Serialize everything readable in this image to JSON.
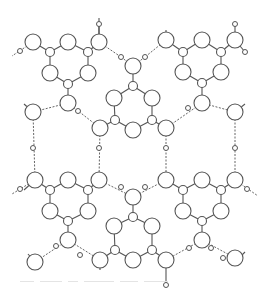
{
  "figure": {
    "colors": {
      "line": "#555555",
      "background": "#ffffff",
      "hbond": "#666666"
    },
    "radii": {
      "large": 8,
      "small": 4.5,
      "hydrogen": 2.5
    },
    "large_atoms": [
      [
        33,
        42
      ],
      [
        68,
        42
      ],
      [
        99,
        42
      ],
      [
        50,
        73
      ],
      [
        88,
        73
      ],
      [
        68,
        103
      ],
      [
        166,
        40
      ],
      [
        202,
        40
      ],
      [
        235,
        40
      ],
      [
        183,
        72
      ],
      [
        221,
        72
      ],
      [
        202,
        103
      ],
      [
        133,
        66
      ],
      [
        114,
        98
      ],
      [
        152,
        98
      ],
      [
        133,
        130
      ],
      [
        100,
        128
      ],
      [
        166,
        128
      ],
      [
        33,
        112
      ],
      [
        235,
        112
      ],
      [
        35,
        180
      ],
      [
        68,
        180
      ],
      [
        99,
        180
      ],
      [
        50,
        211
      ],
      [
        88,
        211
      ],
      [
        68,
        240
      ],
      [
        166,
        180
      ],
      [
        202,
        180
      ],
      [
        235,
        180
      ],
      [
        183,
        211
      ],
      [
        221,
        211
      ],
      [
        202,
        240
      ],
      [
        133,
        197
      ],
      [
        114,
        226
      ],
      [
        152,
        226
      ],
      [
        133,
        260
      ],
      [
        100,
        260
      ],
      [
        166,
        260
      ],
      [
        35,
        262
      ],
      [
        235,
        258
      ]
    ],
    "small_atoms": [
      [
        50,
        52
      ],
      [
        88,
        52
      ],
      [
        68,
        84
      ],
      [
        183,
        52
      ],
      [
        221,
        52
      ],
      [
        202,
        83
      ],
      [
        133,
        86
      ],
      [
        115,
        120
      ],
      [
        152,
        120
      ],
      [
        50,
        190
      ],
      [
        88,
        190
      ],
      [
        68,
        221
      ],
      [
        183,
        190
      ],
      [
        221,
        190
      ],
      [
        202,
        221
      ],
      [
        133,
        217
      ],
      [
        115,
        250
      ],
      [
        152,
        250
      ]
    ],
    "hydrogen_atoms": [
      [
        20,
        51
      ],
      [
        99,
        24
      ],
      [
        121,
        57
      ],
      [
        78,
        111
      ],
      [
        145,
        57
      ],
      [
        188,
        108
      ],
      [
        235,
        24
      ],
      [
        245,
        52
      ],
      [
        33,
        148
      ],
      [
        99,
        148
      ],
      [
        166,
        148
      ],
      [
        235,
        148
      ],
      [
        20,
        189
      ],
      [
        56,
        246
      ],
      [
        80,
        255
      ],
      [
        121,
        187
      ],
      [
        145,
        187
      ],
      [
        189,
        248
      ],
      [
        211,
        248
      ],
      [
        247,
        189
      ],
      [
        166,
        285
      ],
      [
        223,
        258
      ]
    ],
    "bonds": [
      [
        [
          33,
          42
        ],
        [
          50,
          52
        ]
      ],
      [
        [
          50,
          52
        ],
        [
          68,
          42
        ]
      ],
      [
        [
          68,
          42
        ],
        [
          88,
          52
        ]
      ],
      [
        [
          88,
          52
        ],
        [
          99,
          42
        ]
      ],
      [
        [
          50,
          52
        ],
        [
          50,
          73
        ]
      ],
      [
        [
          88,
          52
        ],
        [
          88,
          73
        ]
      ],
      [
        [
          50,
          73
        ],
        [
          68,
          84
        ]
      ],
      [
        [
          88,
          73
        ],
        [
          68,
          84
        ]
      ],
      [
        [
          68,
          84
        ],
        [
          68,
          103
        ]
      ],
      [
        [
          166,
          40
        ],
        [
          183,
          52
        ]
      ],
      [
        [
          183,
          52
        ],
        [
          202,
          40
        ]
      ],
      [
        [
          202,
          40
        ],
        [
          221,
          52
        ]
      ],
      [
        [
          221,
          52
        ],
        [
          235,
          40
        ]
      ],
      [
        [
          183,
          52
        ],
        [
          183,
          72
        ]
      ],
      [
        [
          221,
          52
        ],
        [
          221,
          72
        ]
      ],
      [
        [
          183,
          72
        ],
        [
          202,
          83
        ]
      ],
      [
        [
          221,
          72
        ],
        [
          202,
          83
        ]
      ],
      [
        [
          202,
          83
        ],
        [
          202,
          103
        ]
      ],
      [
        [
          133,
          66
        ],
        [
          133,
          86
        ]
      ],
      [
        [
          133,
          86
        ],
        [
          114,
          98
        ]
      ],
      [
        [
          133,
          86
        ],
        [
          152,
          98
        ]
      ],
      [
        [
          114,
          98
        ],
        [
          115,
          120
        ]
      ],
      [
        [
          152,
          98
        ],
        [
          152,
          120
        ]
      ],
      [
        [
          115,
          120
        ],
        [
          133,
          130
        ]
      ],
      [
        [
          152,
          120
        ],
        [
          133,
          130
        ]
      ],
      [
        [
          115,
          120
        ],
        [
          100,
          128
        ]
      ],
      [
        [
          152,
          120
        ],
        [
          166,
          128
        ]
      ],
      [
        [
          35,
          180
        ],
        [
          50,
          190
        ]
      ],
      [
        [
          50,
          190
        ],
        [
          68,
          180
        ]
      ],
      [
        [
          68,
          180
        ],
        [
          88,
          190
        ]
      ],
      [
        [
          88,
          190
        ],
        [
          99,
          180
        ]
      ],
      [
        [
          50,
          190
        ],
        [
          50,
          211
        ]
      ],
      [
        [
          88,
          190
        ],
        [
          88,
          211
        ]
      ],
      [
        [
          50,
          211
        ],
        [
          68,
          221
        ]
      ],
      [
        [
          88,
          211
        ],
        [
          68,
          221
        ]
      ],
      [
        [
          68,
          221
        ],
        [
          68,
          240
        ]
      ],
      [
        [
          166,
          180
        ],
        [
          183,
          190
        ]
      ],
      [
        [
          183,
          190
        ],
        [
          202,
          180
        ]
      ],
      [
        [
          202,
          180
        ],
        [
          221,
          190
        ]
      ],
      [
        [
          221,
          190
        ],
        [
          235,
          180
        ]
      ],
      [
        [
          183,
          190
        ],
        [
          183,
          211
        ]
      ],
      [
        [
          221,
          190
        ],
        [
          221,
          211
        ]
      ],
      [
        [
          183,
          211
        ],
        [
          202,
          221
        ]
      ],
      [
        [
          221,
          211
        ],
        [
          202,
          221
        ]
      ],
      [
        [
          202,
          221
        ],
        [
          202,
          240
        ]
      ],
      [
        [
          133,
          197
        ],
        [
          133,
          217
        ]
      ],
      [
        [
          133,
          217
        ],
        [
          114,
          226
        ]
      ],
      [
        [
          133,
          217
        ],
        [
          152,
          226
        ]
      ],
      [
        [
          114,
          226
        ],
        [
          115,
          250
        ]
      ],
      [
        [
          152,
          226
        ],
        [
          152,
          250
        ]
      ],
      [
        [
          115,
          250
        ],
        [
          133,
          260
        ]
      ],
      [
        [
          152,
          250
        ],
        [
          133,
          260
        ]
      ],
      [
        [
          115,
          250
        ],
        [
          100,
          260
        ]
      ],
      [
        [
          152,
          250
        ],
        [
          166,
          260
        ]
      ],
      [
        [
          99,
          42
        ],
        [
          99,
          24
        ]
      ],
      [
        [
          99,
          42
        ],
        [
          99,
          18
        ]
      ],
      [
        [
          235,
          40
        ],
        [
          235,
          24
        ]
      ],
      [
        [
          235,
          40
        ],
        [
          245,
          52
        ]
      ],
      [
        [
          33,
          112
        ],
        [
          24,
          104
        ]
      ],
      [
        [
          235,
          112
        ],
        [
          245,
          104
        ]
      ],
      [
        [
          35,
          180
        ],
        [
          24,
          190
        ]
      ],
      [
        [
          235,
          262
        ],
        [
          245,
          252
        ]
      ],
      [
        [
          35,
          262
        ],
        [
          28,
          254
        ]
      ],
      [
        [
          100,
          260
        ],
        [
          100,
          270
        ]
      ],
      [
        [
          166,
          260
        ],
        [
          166,
          285
        ]
      ],
      [
        [
          166,
          40
        ],
        [
          166,
          30
        ]
      ],
      [
        [
          133,
          66
        ],
        [
          133,
          60
        ]
      ]
    ],
    "hbonds": [
      [
        [
          33,
          42
        ],
        [
          12,
          56
        ]
      ],
      [
        [
          99,
          42
        ],
        [
          121,
          57
        ]
      ],
      [
        [
          121,
          57
        ],
        [
          133,
          66
        ]
      ],
      [
        [
          166,
          40
        ],
        [
          145,
          57
        ]
      ],
      [
        [
          145,
          57
        ],
        [
          133,
          66
        ]
      ],
      [
        [
          68,
          103
        ],
        [
          33,
          112
        ]
      ],
      [
        [
          68,
          103
        ],
        [
          100,
          128
        ]
      ],
      [
        [
          202,
          103
        ],
        [
          166,
          128
        ]
      ],
      [
        [
          202,
          103
        ],
        [
          235,
          112
        ]
      ],
      [
        [
          33,
          112
        ],
        [
          35,
          180
        ]
      ],
      [
        [
          100,
          128
        ],
        [
          99,
          180
        ]
      ],
      [
        [
          166,
          128
        ],
        [
          166,
          180
        ]
      ],
      [
        [
          235,
          112
        ],
        [
          235,
          180
        ]
      ],
      [
        [
          35,
          180
        ],
        [
          12,
          194
        ]
      ],
      [
        [
          99,
          180
        ],
        [
          133,
          197
        ]
      ],
      [
        [
          166,
          180
        ],
        [
          133,
          197
        ]
      ],
      [
        [
          235,
          180
        ],
        [
          258,
          196
        ]
      ],
      [
        [
          68,
          240
        ],
        [
          35,
          262
        ]
      ],
      [
        [
          68,
          240
        ],
        [
          100,
          260
        ]
      ],
      [
        [
          202,
          240
        ],
        [
          166,
          260
        ]
      ],
      [
        [
          202,
          240
        ],
        [
          235,
          258
        ]
      ]
    ]
  },
  "caption": {
    "text_legible": false
  }
}
